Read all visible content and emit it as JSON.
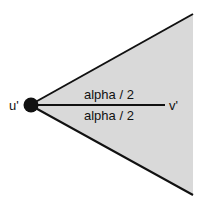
{
  "diagram": {
    "node_u_label": "u'",
    "node_v_label": "v'",
    "angle_upper_label": "alpha / 2",
    "angle_lower_label": "alpha / 2",
    "colors": {
      "cone_fill": "#d9d9d9",
      "stroke": "#111111",
      "node": "#111111",
      "background": "#ffffff"
    }
  }
}
